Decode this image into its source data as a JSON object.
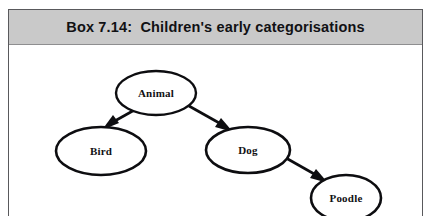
{
  "box": {
    "title": "Box 7.14:  Children's early categorisations",
    "border_color": "#59595c",
    "background_color": "#ffffff"
  },
  "title_band": {
    "background_color": "#c9c9c9",
    "text_color": "#111114"
  },
  "diagram": {
    "type": "hierarchy-tree",
    "stroke_color": "#0d0d10",
    "node_fill": "#ffffff",
    "nodes": [
      {
        "id": "animal",
        "label": "Animal",
        "cx": 147,
        "cy": 48,
        "rx": 40,
        "ry": 22,
        "stroke_width": 2.4
      },
      {
        "id": "bird",
        "label": "Bird",
        "cx": 92,
        "cy": 106,
        "rx": 45,
        "ry": 24,
        "stroke_width": 2.6
      },
      {
        "id": "dog",
        "label": "Dog",
        "cx": 239,
        "cy": 105,
        "rx": 42,
        "ry": 23,
        "stroke_width": 2.6
      },
      {
        "id": "poodle",
        "label": "Poodle",
        "cx": 337,
        "cy": 153,
        "rx": 35,
        "ry": 23,
        "stroke_width": 2.6
      }
    ],
    "edges": [
      {
        "id": "animal-to-bird",
        "from": "animal",
        "to": "bird",
        "x1": 126,
        "y1": 66,
        "x2": 97,
        "y2": 82,
        "stroke_width": 2.6
      },
      {
        "id": "animal-to-dog",
        "from": "animal",
        "to": "dog",
        "x1": 182,
        "y1": 62,
        "x2": 222,
        "y2": 85,
        "stroke_width": 2.6
      },
      {
        "id": "dog-to-poodle",
        "from": "dog",
        "to": "poodle",
        "x1": 278,
        "y1": 114,
        "x2": 316,
        "y2": 135,
        "stroke_width": 2.6
      }
    ]
  }
}
